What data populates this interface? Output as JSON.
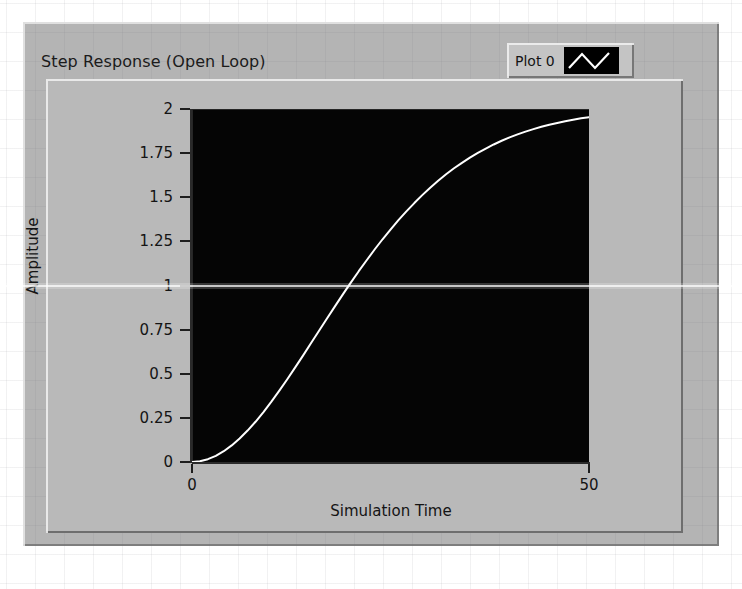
{
  "window": {
    "background_color": "#ffffff",
    "panel_color": "#b4b4b4"
  },
  "graph": {
    "title": "Step Response (Open Loop)",
    "plot_background_color": "#050505",
    "trace_color": "#ffffff"
  },
  "legend": {
    "plot_name": "Plot 0",
    "swatch_icon": "zigzag-line-icon",
    "swatch_background": "#000000"
  },
  "y_axis": {
    "title": "Amplitude",
    "ticks": [
      "2",
      "1.75",
      "1.5",
      "1.25",
      "1",
      "0.75",
      "0.5",
      "0.25",
      "0"
    ],
    "min": 0,
    "max": 2
  },
  "x_axis": {
    "title": "Simulation Time",
    "ticks": [
      "0",
      "50"
    ],
    "min": 0,
    "max": 50
  },
  "chart_data": {
    "type": "line",
    "title": "Step Response (Open Loop)",
    "xlabel": "Simulation Time",
    "ylabel": "Amplitude",
    "xlim": [
      0,
      50
    ],
    "ylim": [
      0,
      2
    ],
    "grid": false,
    "legend_position": "top-right",
    "xticks": [
      0,
      50
    ],
    "yticks": [
      0,
      0.25,
      0.5,
      0.75,
      1,
      1.25,
      1.5,
      1.75,
      2
    ],
    "series": [
      {
        "name": "Plot 0",
        "color": "#ffffff",
        "x": [
          0,
          1,
          2,
          3,
          4,
          5,
          6,
          7,
          8,
          9,
          10,
          11,
          12,
          13,
          14,
          15,
          16,
          17,
          18,
          19,
          20,
          21,
          22,
          23,
          24,
          25,
          26,
          27,
          28,
          29,
          30,
          31,
          32,
          33,
          34,
          35,
          36,
          37,
          38,
          39,
          40,
          41,
          42,
          43,
          44,
          45,
          46,
          47,
          48,
          49,
          50
        ],
        "y": [
          0.0,
          0.004,
          0.016,
          0.035,
          0.061,
          0.094,
          0.133,
          0.178,
          0.228,
          0.283,
          0.342,
          0.404,
          0.469,
          0.536,
          0.604,
          0.674,
          0.744,
          0.813,
          0.882,
          0.95,
          1.016,
          1.081,
          1.143,
          1.204,
          1.262,
          1.317,
          1.37,
          1.42,
          1.467,
          1.512,
          1.554,
          1.593,
          1.63,
          1.664,
          1.695,
          1.724,
          1.751,
          1.776,
          1.799,
          1.82,
          1.839,
          1.856,
          1.872,
          1.886,
          1.899,
          1.911,
          1.921,
          1.931,
          1.939,
          1.947,
          1.954
        ]
      }
    ]
  }
}
